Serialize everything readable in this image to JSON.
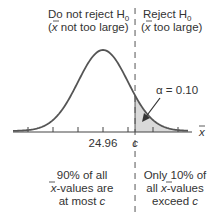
{
  "chart_data": {
    "type": "area",
    "title": "",
    "xlabel": "x̄",
    "distribution": "normal",
    "mean": 24.96,
    "critical_value_label": "c",
    "alpha_label": "α = 0.10",
    "alpha": 0.1,
    "tick_labels": [
      {
        "pos": 0,
        "text": "24.96"
      },
      {
        "pos": 1.2816,
        "text": "c"
      }
    ],
    "x_range_sd": [
      -3,
      3
    ],
    "tick_positions_sd": [
      -3,
      -2,
      -1,
      0,
      1,
      2,
      3
    ],
    "regions": {
      "left_header": {
        "line1": "Do not reject H",
        "sub": "0",
        "line2a": "(",
        "xbar": "x",
        "line2b": " not too large)"
      },
      "right_header": {
        "line1": "Reject H",
        "sub": "0",
        "line2a": "(",
        "xbar": "x",
        "line2b": " too large)"
      },
      "left_footer": {
        "l1": "90% of all",
        "l2xbar": "x",
        "l2": "-values are",
        "l3": "at most ",
        "l3c": "c"
      },
      "right_footer": {
        "l1": "Only 10% of",
        "l2a": "all ",
        "l2xbar": "x",
        "l2": "-values",
        "l3": "exceed ",
        "l3c": "c"
      }
    },
    "colors": {
      "curve": "#555555",
      "shade": "#d9d9d9",
      "axis": "#444444"
    }
  }
}
